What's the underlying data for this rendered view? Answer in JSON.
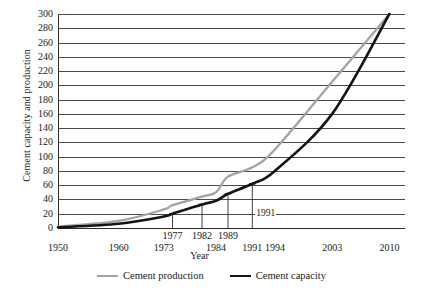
{
  "chart_data": {
    "type": "line",
    "title": "",
    "xlabel": "Year",
    "ylabel": "Cement capacity and production",
    "ylim": [
      0,
      300
    ],
    "ytick_step": 20,
    "yticks": [
      300,
      280,
      260,
      240,
      220,
      200,
      180,
      160,
      140,
      120,
      100,
      80,
      60,
      40,
      20,
      0
    ],
    "xticks": [
      "1950",
      "1960",
      "1973",
      "1977",
      "1982",
      "1984",
      "1989",
      "1991",
      "1994",
      "2003",
      "2010"
    ],
    "xticks_upper_row": [
      "1977",
      "1982",
      "1989"
    ],
    "xticks_lower_row": [
      "1950",
      "1960",
      "1973",
      "1984",
      "1994",
      "2003",
      "2010"
    ],
    "grid": "horizontal",
    "legend_position": "bottom-center",
    "annotations": [
      "1991"
    ],
    "series": [
      {
        "name": "Cement production",
        "color": "#a3a3a3",
        "x": [
          1950,
          1960,
          1973,
          1977,
          1982,
          1984,
          1989,
          1991,
          1994,
          2003,
          2010
        ],
        "values": [
          2,
          10,
          26,
          32,
          44,
          50,
          72,
          85,
          110,
          205,
          300
        ]
      },
      {
        "name": "Cement capacity",
        "color": "#141414",
        "x": [
          1950,
          1960,
          1973,
          1977,
          1982,
          1984,
          1989,
          1991,
          1994,
          2003,
          2010
        ],
        "values": [
          1,
          6,
          16,
          20,
          33,
          38,
          48,
          62,
          80,
          160,
          300
        ],
        "markers": [
          {
            "x": 1977,
            "y": 20,
            "label": "1977"
          },
          {
            "x": 1982,
            "y": 33,
            "label": "1982"
          },
          {
            "x": 1989,
            "y": 48,
            "label": "1989"
          },
          {
            "x": 1991,
            "y": 62,
            "label": "1991"
          }
        ]
      }
    ]
  },
  "legend": {
    "items": [
      {
        "label": "Cement production"
      },
      {
        "label": "Cement capacity"
      }
    ]
  },
  "axis": {
    "y_title": "Cement capacity and production",
    "x_title": "Year"
  }
}
